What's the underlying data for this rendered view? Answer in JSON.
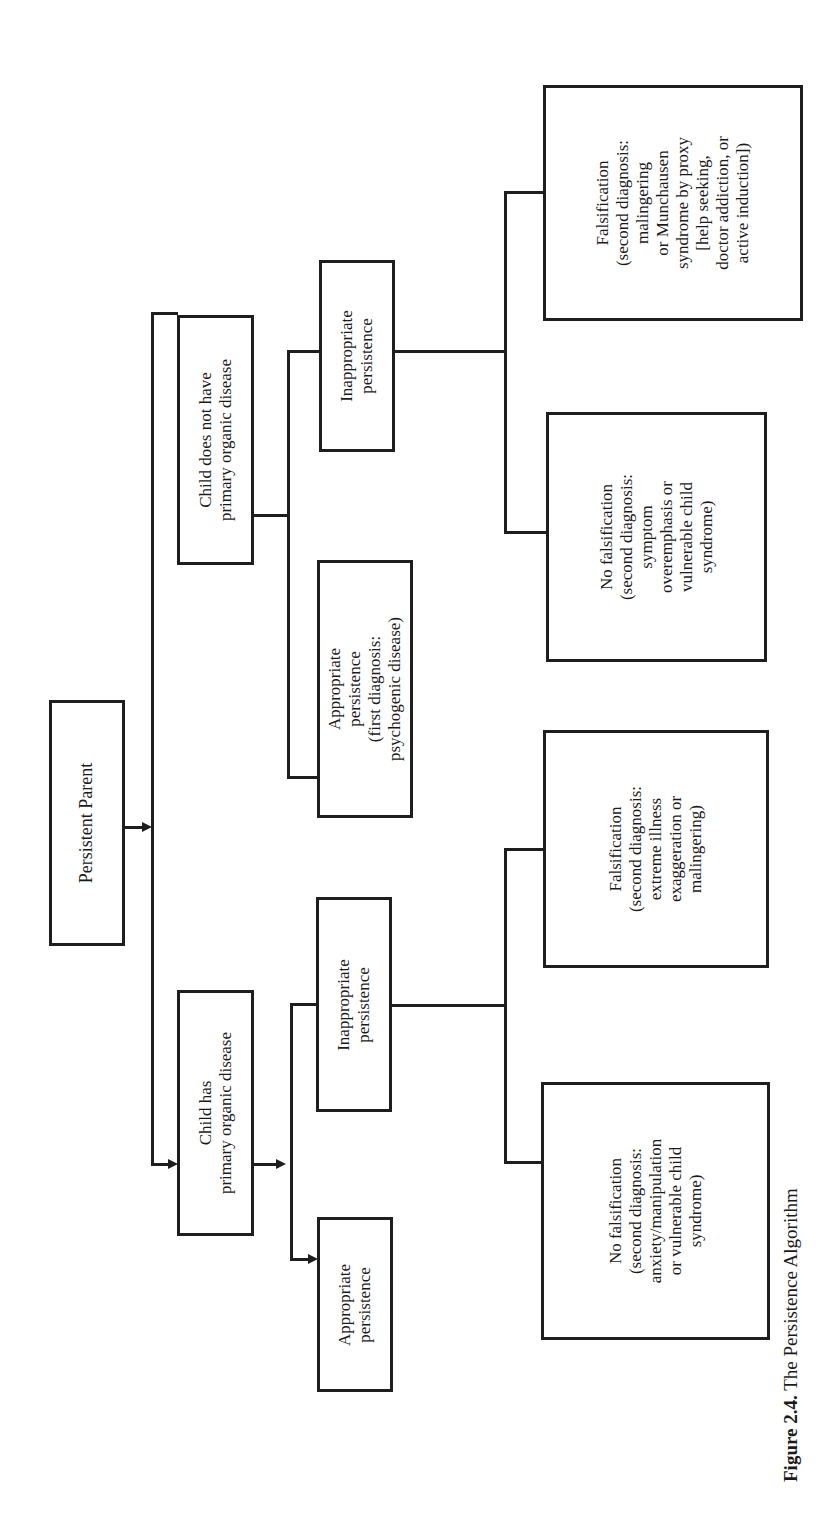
{
  "diagram": {
    "root": {
      "label": "Persistent Parent"
    },
    "level1": {
      "no_disease": {
        "lines": [
          "Child does not have",
          "primary organic disease"
        ]
      },
      "has_disease": {
        "lines": [
          "Child has",
          "primary organic disease"
        ]
      }
    },
    "level2": {
      "no_disease_inappropriate": {
        "lines": [
          "Inappropriate",
          "persistence"
        ]
      },
      "no_disease_appropriate": {
        "lines": [
          "Appropriate",
          "persistence",
          "(first diagnosis:",
          "psychogenic disease)"
        ]
      },
      "has_disease_inappropriate": {
        "lines": [
          "Inappropriate",
          "persistence"
        ]
      },
      "has_disease_appropriate": {
        "lines": [
          "Appropriate",
          "persistence"
        ]
      }
    },
    "level3": {
      "no_disease_falsification": {
        "lines": [
          "Falsification",
          "(second diagnosis:",
          "malingering",
          "or Munchausen",
          "syndrome by proxy",
          "[help seeking,",
          "doctor addiction, or",
          "active induction])"
        ]
      },
      "no_disease_no_falsification": {
        "lines": [
          "No falsification",
          "(second diagnosis:",
          "symptom",
          "overemphasis or",
          "vulnerable child",
          "syndrome)"
        ]
      },
      "has_disease_falsification": {
        "lines": [
          "Falsification",
          "(second diagnosis:",
          "extreme illness",
          "exaggeration or",
          "malingering)"
        ]
      },
      "has_disease_no_falsification": {
        "lines": [
          "No falsification",
          "(second diagnosis:",
          "anxiety/manipulation",
          "or vulnerable child",
          "syndrome)"
        ]
      }
    },
    "caption": {
      "label": "Figure 2.4.",
      "title": " The Persistence Algorithm"
    },
    "colors": {
      "line": "#1e1e1e",
      "background": "#ffffff",
      "text": "#1a1a1a"
    }
  }
}
